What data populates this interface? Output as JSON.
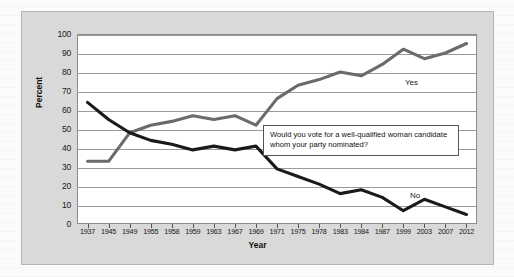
{
  "chart_data": {
    "type": "line",
    "title": "",
    "xlabel": "Year",
    "ylabel": "Percent",
    "ylim": [
      0,
      100
    ],
    "ytick_step": 10,
    "yticks": [
      100,
      90,
      80,
      70,
      60,
      50,
      40,
      30,
      20,
      10,
      0
    ],
    "grid": true,
    "legend_position": "inline-right",
    "categories": [
      "1937",
      "1945",
      "1949",
      "1955",
      "1958",
      "1959",
      "1963",
      "1967",
      "1969",
      "1971",
      "1975",
      "1978",
      "1983",
      "1984",
      "1987",
      "1999",
      "2003",
      "2007",
      "2012"
    ],
    "series": [
      {
        "name": "Yes",
        "color": "#6b6b6b",
        "values": [
          33,
          33,
          48,
          52,
          54,
          57,
          55,
          57,
          52,
          66,
          73,
          76,
          80,
          78,
          84,
          92,
          87,
          90,
          95
        ]
      },
      {
        "name": "No",
        "color": "#1a1a1a",
        "values": [
          64,
          55,
          48,
          44,
          42,
          39,
          41,
          39,
          41,
          29,
          25,
          21,
          16,
          18,
          14,
          7,
          13,
          9,
          5
        ]
      }
    ],
    "annotations": [
      {
        "name": "poll-question",
        "text": "Would you vote for a well-qualified woman candidate whom your party nominated?"
      }
    ]
  },
  "labels": {
    "yes_series_label": "Yes",
    "no_series_label": "No"
  }
}
